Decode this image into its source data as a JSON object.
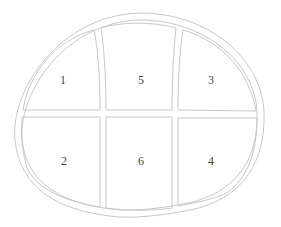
{
  "diagram": {
    "type": "partitioned-rounded-shape",
    "stroke_color": "#c8c8c8",
    "label_color": "#444444",
    "regions": [
      {
        "id": "1",
        "label": "1",
        "row": "top",
        "col": "left"
      },
      {
        "id": "5",
        "label": "5",
        "row": "top",
        "col": "middle"
      },
      {
        "id": "3",
        "label": "3",
        "row": "top",
        "col": "right"
      },
      {
        "id": "2",
        "label": "2",
        "row": "bottom",
        "col": "left"
      },
      {
        "id": "6",
        "label": "6",
        "row": "bottom",
        "col": "middle"
      },
      {
        "id": "4",
        "label": "4",
        "row": "bottom",
        "col": "right"
      }
    ]
  }
}
